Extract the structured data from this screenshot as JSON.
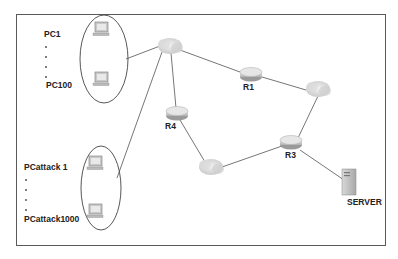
{
  "diagram": {
    "type": "network-topology",
    "groups": [
      {
        "id": "legit-clients",
        "first_label": "PC1",
        "last_label": "PC100",
        "count_range": "1-100"
      },
      {
        "id": "attack-clients",
        "first_label": "PCattack 1",
        "last_label": "PCattack1000",
        "count_range": "1-1000"
      }
    ],
    "nodes": [
      {
        "id": "cloud-a",
        "kind": "cloud",
        "label": ""
      },
      {
        "id": "cloud-b",
        "kind": "cloud",
        "label": ""
      },
      {
        "id": "cloud-c",
        "kind": "cloud",
        "label": ""
      },
      {
        "id": "R1",
        "kind": "router",
        "label": "R1"
      },
      {
        "id": "R3",
        "kind": "router",
        "label": "R3"
      },
      {
        "id": "R4",
        "kind": "router",
        "label": "R4"
      },
      {
        "id": "server",
        "kind": "server",
        "label": "SERVER"
      }
    ],
    "edges": [
      [
        "legit-clients",
        "cloud-a"
      ],
      [
        "attack-clients",
        "cloud-a"
      ],
      [
        "cloud-a",
        "R1"
      ],
      [
        "cloud-a",
        "R4"
      ],
      [
        "R1",
        "cloud-b"
      ],
      [
        "cloud-b",
        "R3"
      ],
      [
        "R4",
        "cloud-c"
      ],
      [
        "cloud-c",
        "R3"
      ],
      [
        "R3",
        "server"
      ]
    ]
  },
  "labels": {
    "pc1": "PC1",
    "pc100": "PC100",
    "pcattack1": "PCattack 1",
    "pcattack1000": "PCattack1000",
    "r1": "R1",
    "r3": "R3",
    "r4": "R4",
    "server": "SERVER"
  }
}
